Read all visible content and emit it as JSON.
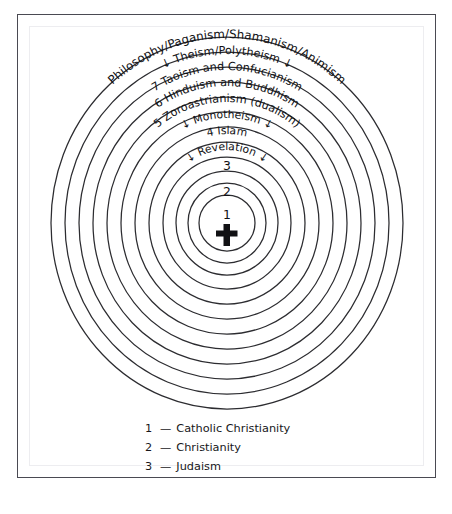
{
  "figure": {
    "center_icon": "latin-cross-icon",
    "center_number": "1",
    "ring_color": "#2c2c30",
    "background_color": "#ffffff",
    "frame_color": "#4a4a52"
  },
  "rings": {
    "arc_labels": [
      {
        "id": "philosophy",
        "text": "Philosophy/Paganism/Shamanism/Animism"
      },
      {
        "id": "theism",
        "text": "Theism/Polytheism"
      },
      {
        "id": "taoism",
        "text": "7 Taoism and Confucianism"
      },
      {
        "id": "hinduism",
        "text": "6 Hinduism and Buddhism"
      },
      {
        "id": "zoroastrianism",
        "text": "5 Zoroastrianism (dualism)"
      },
      {
        "id": "monotheism",
        "text": "Monotheism"
      },
      {
        "id": "islam",
        "text": "4 Islam"
      },
      {
        "id": "revelation",
        "text": "Revelation"
      }
    ],
    "arrow_glyph": "↓",
    "numbers": [
      {
        "id": "three",
        "text": "3"
      },
      {
        "id": "two",
        "text": "2"
      },
      {
        "id": "one",
        "text": "1"
      }
    ]
  },
  "legend": {
    "dash": "—",
    "items": [
      {
        "key": "1",
        "label": "Catholic Christianity"
      },
      {
        "key": "2",
        "label": "Christianity"
      },
      {
        "key": "3",
        "label": "Judaism"
      }
    ]
  }
}
